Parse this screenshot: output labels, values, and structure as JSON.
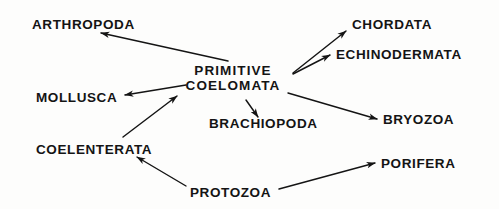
{
  "diagram": {
    "type": "phylogenetic-relationship-diagram",
    "background_color": "#fdfdfc",
    "ink_color": "#141414",
    "nodes": [
      {
        "id": "arthropoda",
        "label": "ARTHROPODA",
        "x": 32,
        "y": 17,
        "anchor": "left"
      },
      {
        "id": "chordata",
        "label": "CHORDATA",
        "x": 352,
        "y": 17,
        "anchor": "left"
      },
      {
        "id": "echinodermata",
        "label": "ECHINODERMATA",
        "x": 336,
        "y": 47,
        "anchor": "left"
      },
      {
        "id": "primitive-coelomata",
        "label_line1": "PRIMITIVE",
        "label_line2": "COELOMATA",
        "x": 232,
        "y": 63,
        "anchor": "center"
      },
      {
        "id": "mollusca",
        "label": "MOLLUSCA",
        "x": 36,
        "y": 90,
        "anchor": "left"
      },
      {
        "id": "bryozoa",
        "label": "BRYOZOA",
        "x": 383,
        "y": 112,
        "anchor": "left"
      },
      {
        "id": "brachiopoda",
        "label": "BRACHIOPODA",
        "x": 209,
        "y": 116,
        "anchor": "left"
      },
      {
        "id": "coelenterata",
        "label": "COELENTERATA",
        "x": 36,
        "y": 142,
        "anchor": "left"
      },
      {
        "id": "porifera",
        "label": "PORIFERA",
        "x": 381,
        "y": 156,
        "anchor": "left"
      },
      {
        "id": "protozoa",
        "label": "PROTOZOA",
        "x": 190,
        "y": 185,
        "anchor": "left"
      }
    ],
    "edges": [
      {
        "id": "coelomata-to-arthropoda",
        "from": "primitive-coelomata",
        "to": "arthropoda",
        "arrow": "head-at-to"
      },
      {
        "id": "coelomata-to-chordata",
        "from": "primitive-coelomata",
        "to": "chordata",
        "arrow": "head-at-to"
      },
      {
        "id": "coelomata-to-echinodermata",
        "from": "primitive-coelomata",
        "to": "echinodermata",
        "arrow": "head-at-to"
      },
      {
        "id": "coelomata-to-mollusca",
        "from": "primitive-coelomata",
        "to": "mollusca",
        "arrow": "head-at-to"
      },
      {
        "id": "coelomata-to-brachiopoda",
        "from": "primitive-coelomata",
        "to": "brachiopoda",
        "arrow": "head-at-to"
      },
      {
        "id": "coelomata-to-bryozoa",
        "from": "primitive-coelomata",
        "to": "bryozoa",
        "arrow": "head-at-to"
      },
      {
        "id": "coelenterata-to-coelomata",
        "from": "coelenterata",
        "to": "primitive-coelomata",
        "arrow": "head-at-to"
      },
      {
        "id": "protozoa-to-coelenterata",
        "from": "protozoa",
        "to": "coelenterata",
        "arrow": "head-at-to"
      },
      {
        "id": "protozoa-to-porifera",
        "from": "protozoa",
        "to": "porifera",
        "arrow": "head-at-to"
      }
    ]
  }
}
